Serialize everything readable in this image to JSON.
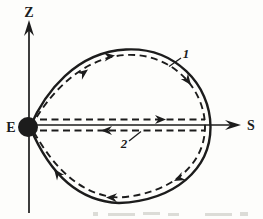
{
  "colors": {
    "ink": "#1c1c1c",
    "paper": "#fdfdfb",
    "faint": "#c7c7bf"
  },
  "figure": {
    "labels": {
      "z_axis": "Z",
      "s_axis": "S",
      "earth": "E",
      "trajectory_oval": "1",
      "trajectory_radial": "2"
    }
  }
}
